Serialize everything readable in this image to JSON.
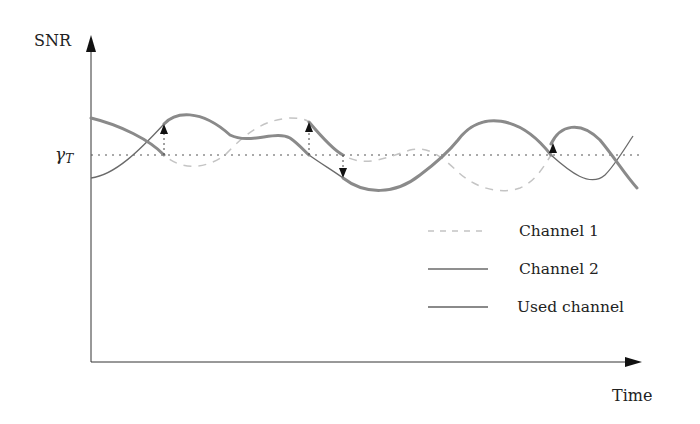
{
  "diagram": {
    "y_axis_label": "SNR",
    "x_axis_label": "Time",
    "threshold_label_base": "γ",
    "threshold_label_sub": "T",
    "legend": [
      {
        "label": "Channel 1",
        "style": "dashed",
        "color": "#c4c4c4"
      },
      {
        "label": "Channel 2",
        "style": "solid-thin",
        "color": "#6a6a6a"
      },
      {
        "label": "Used channel",
        "style": "solid-thick",
        "color": "#8a8a8a"
      }
    ],
    "switch_events": [
      {
        "index": 1,
        "direction": "up"
      },
      {
        "index": 2,
        "direction": "up"
      },
      {
        "index": 3,
        "direction": "down"
      },
      {
        "index": 4,
        "direction": "up"
      }
    ]
  }
}
